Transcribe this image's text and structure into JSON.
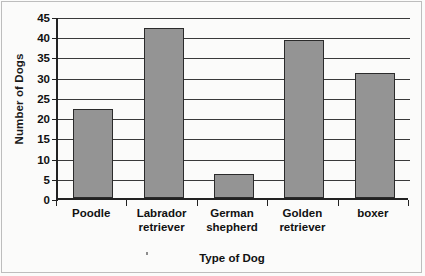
{
  "chart_data": {
    "type": "bar",
    "title": "",
    "xlabel": "Type of Dog",
    "ylabel": "Number of Dogs",
    "categories": [
      "Poodle",
      "Labrador retriever",
      "German shepherd",
      "Golden retriever",
      "boxer"
    ],
    "category_lines": [
      [
        "Poodle"
      ],
      [
        "Labrador",
        "retriever"
      ],
      [
        "German",
        "shepherd"
      ],
      [
        "Golden",
        "retriever"
      ],
      [
        "boxer"
      ]
    ],
    "values": [
      22,
      42,
      6,
      39,
      31
    ],
    "ylim": [
      0,
      45
    ],
    "ytick_step": 5,
    "yticks": [
      0,
      5,
      10,
      15,
      20,
      25,
      30,
      35,
      40,
      45
    ],
    "ytick_labels": [
      "0",
      "5",
      "10",
      "15",
      "20",
      "25",
      "30",
      "35",
      "40",
      "45"
    ],
    "grid": true,
    "grid_orientation": "horizontal",
    "legend": false,
    "bar_color": "#949494",
    "bar_edge_color": "#2b2b2b",
    "axis_color": "#222222",
    "background": "#fbfbfa"
  }
}
